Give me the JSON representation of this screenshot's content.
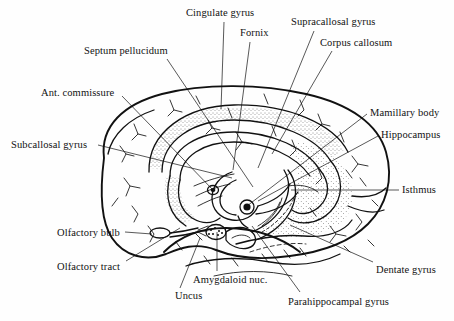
{
  "figure": {
    "kind": "anatomical-line-drawing",
    "background_color": "#fefefe",
    "ink_color": "#111111",
    "width": 454,
    "height": 321
  },
  "labels": [
    {
      "id": "cingulate-gyrus",
      "text": "Cingulate gyrus",
      "x": 186,
      "y": 8,
      "leader": "M 224 22 L 221 109"
    },
    {
      "id": "fornix",
      "text": "Fornix",
      "x": 240,
      "y": 28,
      "leader": "M 250 42 L 233 170"
    },
    {
      "id": "supracallosal-gyrus",
      "text": "Supracallosal gyrus",
      "x": 291,
      "y": 17,
      "leader": "M 314 31 L 258 168"
    },
    {
      "id": "corpus-callosum",
      "text": "Corpus callosum",
      "x": 320,
      "y": 38,
      "leader": "M 332 51 L 272 154"
    },
    {
      "id": "septum-pellucidum",
      "text": "Septum pellucidum",
      "x": 84,
      "y": 46,
      "leader": "M 167 59 L 253 187"
    },
    {
      "id": "ant-commissure",
      "text": "Ant. commissure",
      "x": 41,
      "y": 88,
      "leader": "M 122 96 L 213 190"
    },
    {
      "id": "subcallosal-gyrus",
      "text": "Subcallosal gyrus",
      "x": 11,
      "y": 140,
      "leader": "M 98 145 L 232 178"
    },
    {
      "id": "olfactory-bulb",
      "text": "Olfactory bulb",
      "x": 57,
      "y": 228,
      "leader": "M 125 232 L 152 234"
    },
    {
      "id": "olfactory-tract",
      "text": "Olfactory tract",
      "x": 57,
      "y": 262,
      "leader": "M 126 261 L 180 228"
    },
    {
      "id": "uncus",
      "text": "Uncus",
      "x": 175,
      "y": 291,
      "leader": "M 180 288 L 200 238"
    },
    {
      "id": "amygdaloid-nuc",
      "text": "Amygdaloid nuc.",
      "x": 193,
      "y": 275,
      "leader": "M 217 271 L 217 232"
    },
    {
      "id": "parahippocampal-gyrus",
      "text": "Parahippocampal gyrus",
      "x": 288,
      "y": 297,
      "leader": "M 300 292 L 252 226"
    },
    {
      "id": "dentate-gyrus",
      "text": "Dentate gyrus",
      "x": 376,
      "y": 265,
      "leader": "M 373 262 L 290 225"
    },
    {
      "id": "isthmus",
      "text": "Isthmus",
      "x": 402,
      "y": 185,
      "leader": "M 399 190 L 291 190"
    },
    {
      "id": "hippocampus",
      "text": "Hippocampus",
      "x": 381,
      "y": 130,
      "leader": "M 378 136 L 258 201"
    },
    {
      "id": "mamillary-body",
      "text": "Mamillary body",
      "x": 370,
      "y": 108,
      "leader": "M 367 114 L 247 206"
    }
  ]
}
